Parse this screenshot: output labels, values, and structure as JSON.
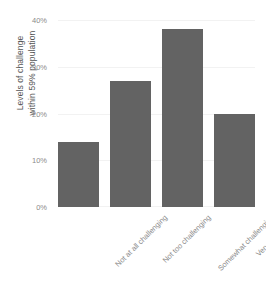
{
  "chart_data": {
    "type": "bar",
    "title": "",
    "subtitle": "",
    "xlabel": "",
    "ylabel": "Levels of challenge within 59% population",
    "ylabel_lines": [
      "Levels of challenge",
      "within 59% population"
    ],
    "categories": [
      "Not at all challenging",
      "Not too challenging",
      "Somewhat challenging",
      "Very challenging"
    ],
    "values": [
      14,
      27,
      38,
      20
    ],
    "ylim": [
      0,
      40
    ],
    "ytick_values": [
      0,
      10,
      20,
      30,
      40
    ],
    "ytick_labels": [
      "0%",
      "10%",
      "20%",
      "30%",
      "40%"
    ],
    "grid": true,
    "legend": null,
    "legend_position": "none",
    "bar_color": "#636363",
    "grid_color": "#f2f2f2",
    "tick_label_color": "#8a8a8a",
    "axis_title_color": "#555555",
    "background_color": "#ffffff"
  }
}
